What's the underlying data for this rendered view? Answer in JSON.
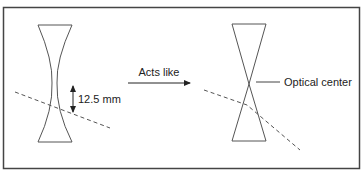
{
  "diagram": {
    "left_lens": {
      "type": "concave-lens",
      "measurement_label": "12.5 mm"
    },
    "transition": {
      "label": "Acts like"
    },
    "right_lens": {
      "type": "prism-pair-equivalent",
      "annotation_label": "Optical center"
    },
    "colors": {
      "stroke": "#555555",
      "text": "#222222",
      "border": "#444444",
      "background": "#ffffff"
    }
  }
}
